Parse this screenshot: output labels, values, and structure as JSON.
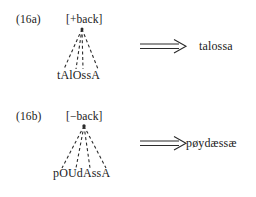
{
  "figure": {
    "type": "autosegmental-derivation-diagram",
    "background_color": "#ffffff",
    "text_color": "#1a1a1a",
    "arrow_glyph": "double-right-arrow"
  },
  "examples": [
    {
      "number": "(16a)",
      "feature": "[+back]",
      "underlying_form": "tAlOssA",
      "surface_form": "talossa",
      "association_line_count": 4,
      "association_line_style": "dashed"
    },
    {
      "number": "(16b)",
      "feature": "[−back]",
      "underlying_form": "pOUdAssA",
      "surface_form": "pøydæssæ",
      "association_line_count": 4,
      "association_line_style": "dashed"
    }
  ]
}
